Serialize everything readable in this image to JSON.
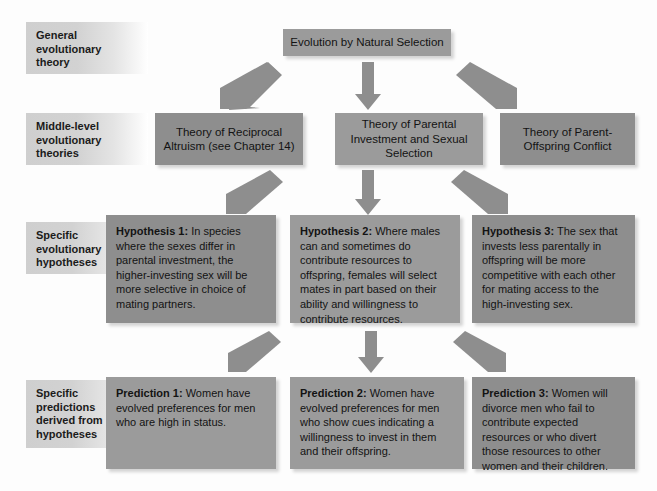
{
  "diagram": {
    "accent_box_color": "#9b9b9b",
    "accent_box_color_dark": "#8e8e8e",
    "label_gradient_start": "#cfcfcf",
    "background_color": "#fdfdfd",
    "text_color": "#131313"
  },
  "row_labels": [
    {
      "id": "general",
      "text": "General evolutionary theory"
    },
    {
      "id": "middle",
      "text": "Middle-level evolutionary theories"
    },
    {
      "id": "hypotheses",
      "text": "Specific evolutionary hypotheses"
    },
    {
      "id": "predictions",
      "text": "Specific predictions derived from hypotheses"
    }
  ],
  "level_1": {
    "box": {
      "label": "Evolution by Natural Selection"
    }
  },
  "level_2": {
    "boxes": [
      {
        "label": "Theory of Reciprocal Altruism (see Chapter 14)"
      },
      {
        "label": "Theory of Parental Investment and Sexual Selection"
      },
      {
        "label": "Theory of Parent-Offspring Conflict"
      }
    ]
  },
  "level_3": {
    "boxes": [
      {
        "lead": "Hypothesis 1:",
        "body": " In species where the sexes differ in parental investment, the higher-investing sex will be more selective in choice of mating partners."
      },
      {
        "lead": "Hypothesis 2:",
        "body": " Where males can and sometimes do contribute resources to offspring, females will select mates in part based on their ability and willingness to contribute resources."
      },
      {
        "lead": "Hypothesis 3:",
        "body": " The sex that invests less parentally in offspring will be more competitive with each other for mating access to the high-investing sex."
      }
    ]
  },
  "level_4": {
    "boxes": [
      {
        "lead": "Prediction 1:",
        "body": " Women have evolved preferences for men who are high in status."
      },
      {
        "lead": "Prediction 2:",
        "body": " Women have evolved preferences for men who show cues indicating a willingness to invest in them and their offspring."
      },
      {
        "lead": "Prediction 3:",
        "body": " Women will divorce men who fail to contribute expected resources or who divert those resources to other women and their children."
      }
    ]
  },
  "arrows": {
    "group_1": [
      {
        "name": "arrow-natural-selection-to-reciprocal-altruism",
        "direction": "down-left"
      },
      {
        "name": "arrow-natural-selection-to-parental-investment",
        "direction": "down"
      },
      {
        "name": "arrow-natural-selection-to-parent-offspring",
        "direction": "down-right"
      }
    ],
    "group_2": [
      {
        "name": "arrow-theory-to-hypothesis-1",
        "direction": "down-left"
      },
      {
        "name": "arrow-theory-to-hypothesis-2",
        "direction": "down"
      },
      {
        "name": "arrow-theory-to-hypothesis-3",
        "direction": "down-right"
      }
    ],
    "group_3": [
      {
        "name": "arrow-hypothesis-to-prediction-1",
        "direction": "down-left"
      },
      {
        "name": "arrow-hypothesis-to-prediction-2",
        "direction": "down"
      },
      {
        "name": "arrow-hypothesis-to-prediction-3",
        "direction": "down-right"
      }
    ]
  }
}
